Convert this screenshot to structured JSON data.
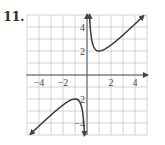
{
  "problem": {
    "number": "11."
  },
  "chart_data": {
    "type": "line",
    "title": "",
    "function": "y = x + 1/x",
    "xlabel": "",
    "ylabel": "",
    "xlim": [
      -5,
      5
    ],
    "ylim": [
      -5,
      5
    ],
    "grid": true,
    "grid_step": 1,
    "x_tick_labels": [
      {
        "value": -4,
        "label": "−4"
      },
      {
        "value": -2,
        "label": "−2"
      },
      {
        "value": 2,
        "label": "2"
      },
      {
        "value": 4,
        "label": "4"
      }
    ],
    "y_tick_labels": [
      {
        "value": 4,
        "label": "4"
      },
      {
        "value": 2,
        "label": "2"
      },
      {
        "value": -2,
        "label": "−2"
      },
      {
        "value": -4,
        "label": "−4"
      }
    ],
    "series": [
      {
        "name": "right branch",
        "x": [
          0.2,
          0.3,
          0.5,
          0.75,
          1,
          1.5,
          2,
          3,
          4,
          4.75
        ],
        "y": [
          5.2,
          3.63,
          2.5,
          2.08,
          2,
          2.17,
          2.5,
          3.33,
          4.25,
          4.96
        ]
      },
      {
        "name": "left branch",
        "x": [
          -5,
          -4,
          -3,
          -2,
          -1.5,
          -1,
          -0.75,
          -0.5,
          -0.3,
          -0.2
        ],
        "y": [
          -5.2,
          -4.25,
          -3.33,
          -2.5,
          -2.17,
          -2,
          -2.08,
          -2.5,
          -3.63,
          -5.2
        ]
      }
    ],
    "key_points": [
      {
        "label": "local min",
        "x": 1,
        "y": 2
      },
      {
        "label": "local max",
        "x": -1,
        "y": -2
      }
    ],
    "asymptotes": [
      "x = 0",
      "y = x"
    ],
    "colors": {
      "curve": "#3a3a3a",
      "grid": "#c8c8c8",
      "axis": "#555555"
    }
  }
}
